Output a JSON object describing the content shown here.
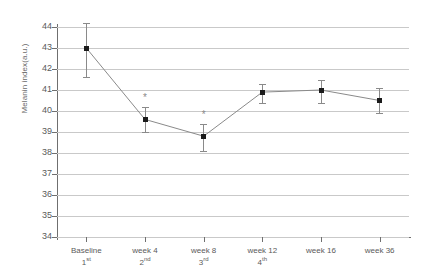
{
  "chart_data": {
    "type": "line",
    "title": "",
    "xlabel": "",
    "ylabel": "Melanin index(a.u.)",
    "categories": [
      "Baseline",
      "week 4",
      "week 8",
      "week 12",
      "week 16",
      "week 36"
    ],
    "category_ordinals": [
      "1st",
      "2nd",
      "3rd",
      "4th",
      "",
      ""
    ],
    "values": [
      43.0,
      39.6,
      38.8,
      40.9,
      41.0,
      40.5
    ],
    "error_upper": [
      44.2,
      40.2,
      39.4,
      41.3,
      41.5,
      41.1
    ],
    "error_lower": [
      41.6,
      39.0,
      38.1,
      40.4,
      40.4,
      39.9
    ],
    "significance_markers": [
      "",
      "*",
      "*",
      "",
      "",
      ""
    ],
    "ylim": [
      34,
      44
    ],
    "yticks": [
      44,
      43,
      42,
      41,
      40,
      39,
      38,
      37,
      36,
      35,
      34
    ],
    "ytick_labels": [
      "44",
      "43",
      "42",
      "41",
      "40",
      "39",
      "38",
      "37",
      "36",
      "35",
      "34"
    ],
    "grid": true,
    "legend": "none",
    "marker_color": "#1b1b1b",
    "line_color": "#8a8a8a",
    "error_color": "#8a8a8a",
    "grid_color": "#c9c9c9",
    "axis_color": "#6f6f6f"
  }
}
